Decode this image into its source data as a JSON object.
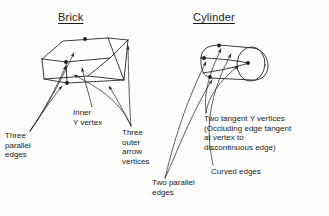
{
  "figure": {
    "background_color": "#fdfdfb",
    "ink_color": "#1b1b1b"
  },
  "panels": {
    "brick": {
      "title": "Brick",
      "shape_icon": "brick-wireframe-icon"
    },
    "cylinder": {
      "title": "Cylinder",
      "shape_icon": "cylinder-wireframe-icon"
    }
  },
  "labels": {
    "three_parallel_edges": "Three\nparallel\nedges",
    "inner_y_vertex": "Inner\nY vertex",
    "three_outer_arrow_vertices": "Three\nouter\narrow\nvertices",
    "two_tangent_y_vertices": "Two tangent Y vertices\n(Occluding edge tangent\nat vertex to\ndiscontinuous edge)",
    "curved_edges": "Curved edges",
    "two_parallel_edges": "Two parallel\nedges"
  }
}
